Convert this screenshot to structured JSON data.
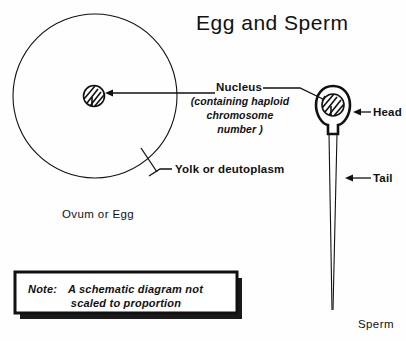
{
  "figure": {
    "title": "Egg and Sperm",
    "note": {
      "prefix": "Note:",
      "line1": "A schematic diagram not",
      "line2": "scaled to proportion"
    },
    "labels": {
      "nucleus": "Nucleus",
      "nucleus_sub_line1": "(containing haploid",
      "nucleus_sub_line2": "chromosome",
      "nucleus_sub_line3": "number )",
      "yolk": "Yolk or deutoplasm",
      "ovum": "Ovum or Egg",
      "head": "Head",
      "tail": "Tail",
      "sperm": "Sperm"
    },
    "colors": {
      "ink": "#111111",
      "paper": "#fefefe"
    },
    "parts": {
      "ovum_circle": "ovum-cell-outline",
      "ovum_nucleus": "ovum-nucleus",
      "sperm_head": "sperm-head-outline",
      "sperm_nucleus": "sperm-nucleus",
      "sperm_tail": "sperm-tail"
    }
  }
}
